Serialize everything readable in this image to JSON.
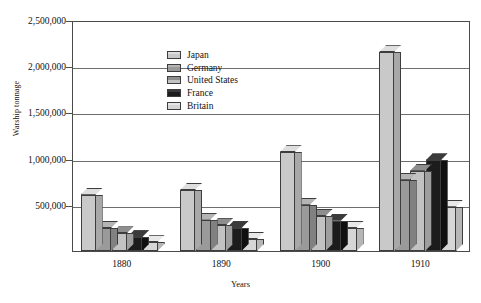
{
  "chart_data": {
    "type": "bar",
    "title": "",
    "xlabel": "Years",
    "ylabel": "Warship tonnage",
    "categories": [
      "1880",
      "1890",
      "1900",
      "1910"
    ],
    "ylim": [
      0,
      2500000
    ],
    "ytick_values": [
      500000,
      1000000,
      1500000,
      2000000,
      2500000
    ],
    "ytick_labels": [
      "500,000",
      "1,000,000",
      "1,500,000",
      "2,000,000",
      "2,500,000"
    ],
    "grid": true,
    "legend_position": "top-left-inside",
    "series": [
      {
        "name": "Japan",
        "color": "#c9c9c9",
        "top_color": "#dedede",
        "side_color": "#a8a8a8",
        "values": [
          610000,
          660000,
          1070000,
          2150000
        ]
      },
      {
        "name": "Germany",
        "color": "#9a9a9a",
        "top_color": "#b4b4b4",
        "side_color": "#818181",
        "values": [
          250000,
          340000,
          500000,
          770000
        ]
      },
      {
        "name": "United States",
        "color": "#c2c2c2",
        "top_color": "#8e8e8e",
        "side_color": "#9e9e9e",
        "values": [
          190000,
          280000,
          380000,
          870000
        ]
      },
      {
        "name": "France",
        "color": "#1c1c1c",
        "top_color": "#3a3a3a",
        "side_color": "#101010",
        "values": [
          150000,
          250000,
          330000,
          980000
        ]
      },
      {
        "name": "Britain",
        "color": "#d6d6d6",
        "top_color": "#e8e8e8",
        "side_color": "#b6b6b6",
        "values": [
          95000,
          130000,
          250000,
          480000
        ]
      }
    ]
  }
}
